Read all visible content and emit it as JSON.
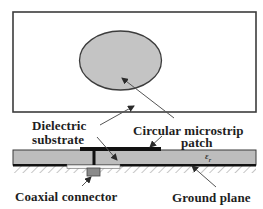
{
  "figure": {
    "type": "antenna-structure-diagram",
    "views": [
      "top-view",
      "side-cross-section"
    ],
    "colors": {
      "outline": "#3c3c3c",
      "patch_fill": "#c4c4c4",
      "substrate_fill": "#bdbdbd",
      "metal": "#111111",
      "slot": "#f4f4f4",
      "connector": "#8a8a8a",
      "hatch": "#b8b8b8",
      "arrow": "#555555",
      "text": "#1e1e1e"
    }
  },
  "labels": {
    "dielectric_line1": "Dielectric",
    "dielectric_line2": "substrate",
    "patch_line1": "Circular microstrip",
    "patch_line2": "patch",
    "coax": "Coaxial connector",
    "ground": "Ground plane",
    "permittivity_symbol": "ε",
    "permittivity_subscript": "r"
  }
}
